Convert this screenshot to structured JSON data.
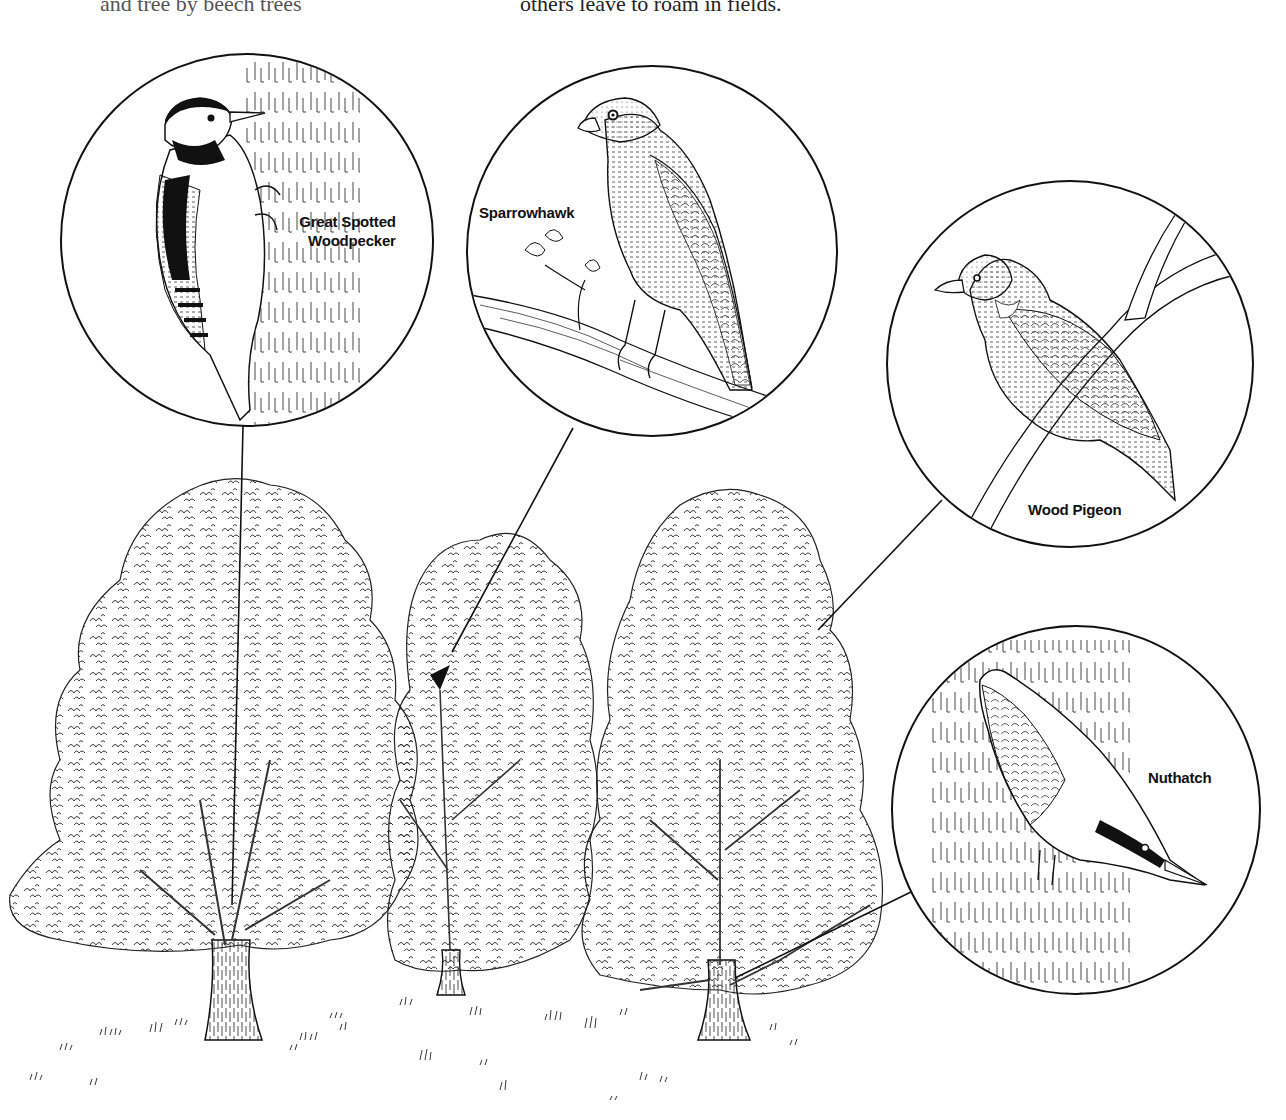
{
  "page": {
    "top_text_left": "and tree by beech trees",
    "top_text_center": "others leave to roam in fields."
  },
  "illustration": {
    "title": "Woodland birds and their trees",
    "line_color": "#111111",
    "background": "#ffffff",
    "callouts": [
      {
        "id": "woodpecker",
        "label_line1": "Great Spotted",
        "label_line2": "Woodpecker",
        "circle": {
          "cx": 247,
          "cy": 240,
          "r": 186
        }
      },
      {
        "id": "sparrowhawk",
        "label": "Sparrowhawk",
        "circle": {
          "cx": 652,
          "cy": 251,
          "r": 185
        }
      },
      {
        "id": "pigeon",
        "label": "Wood Pigeon",
        "circle": {
          "cx": 1070,
          "cy": 364,
          "r": 183
        }
      },
      {
        "id": "nuthatch",
        "label": "Nuthatch",
        "circle": {
          "cx": 1076,
          "cy": 810,
          "r": 184
        }
      }
    ],
    "trees_count": 3
  }
}
